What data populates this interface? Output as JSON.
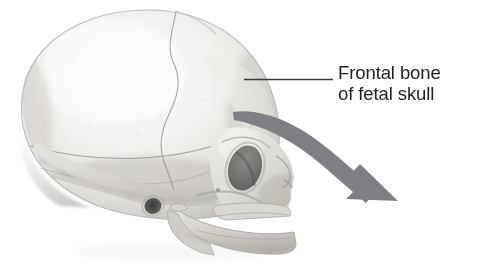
{
  "figure": {
    "name": "fetal-skull-lateral-view",
    "background_color": "#ffffff",
    "width": 483,
    "height": 267
  },
  "annotation": {
    "line1": "Frontal bone",
    "line2": "of fetal skull",
    "text_color": "#231f20",
    "leader_line": {
      "name": "leader-line",
      "color": "#3a3a3c",
      "x1": 244,
      "y1": 79.5,
      "x2": 333,
      "y2": 79.5,
      "thickness": 1.6
    },
    "curved_arrow": {
      "name": "curved-arrow",
      "color": "#7f8083",
      "description": "curved gray arrow sweeping from frontal bone down to lower right",
      "tip_x": 398,
      "tip_y": 201
    }
  },
  "skull": {
    "label": "fetal skull lateral view",
    "bone_light": "#f2f1ef",
    "bone_mid": "#dedcd8",
    "bone_shadow": "#bcbab6",
    "bone_dark": "#9b9894",
    "orbit_color": "#6f6d6b",
    "ear_canal_color": "#454443",
    "parts": [
      {
        "name": "cranium-parietal",
        "label": "Parietal bone"
      },
      {
        "name": "cranium-frontal",
        "label": "Frontal bone"
      },
      {
        "name": "coronal-suture",
        "label": "Coronal suture"
      },
      {
        "name": "squamous-suture",
        "label": "Squamous suture"
      },
      {
        "name": "temporal-bone",
        "label": "Temporal bone"
      },
      {
        "name": "eye-orbit",
        "label": "Orbit"
      },
      {
        "name": "ear-canal",
        "label": "External acoustic meatus"
      },
      {
        "name": "maxilla",
        "label": "Maxilla"
      },
      {
        "name": "mandible",
        "label": "Mandible"
      },
      {
        "name": "zygomatic-arch",
        "label": "Zygomatic arch"
      },
      {
        "name": "nasal-region",
        "label": "Nasal region"
      }
    ]
  }
}
